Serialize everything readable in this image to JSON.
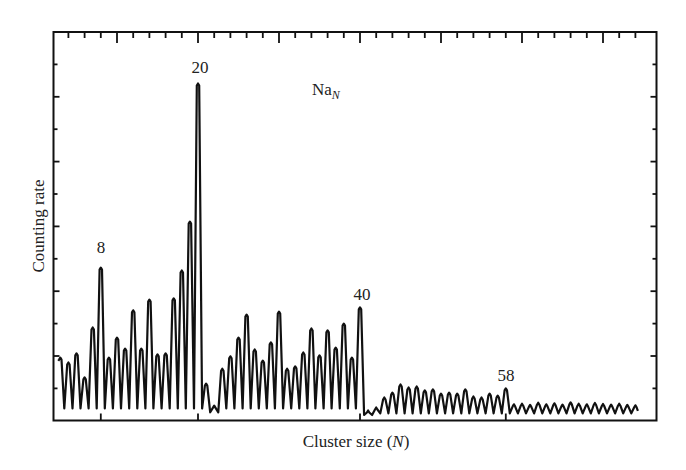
{
  "chart_data": {
    "type": "line",
    "title": "",
    "annotation_species": "Na",
    "annotation_species_subscript": "N",
    "xlabel": "Cluster size",
    "xlabel_var": "N",
    "ylabel": "Counting rate",
    "xlim": [
      2,
      77
    ],
    "ylim": [
      0,
      12
    ],
    "grid": false,
    "legend": null,
    "x_major_tick_step": 10,
    "x_minor_tick_step": 2,
    "y_tick_count": 11,
    "tick_labels_shown": false,
    "peak_annotations": [
      {
        "label": "8",
        "n": 8
      },
      {
        "label": "20",
        "n": 20
      },
      {
        "label": "40",
        "n": 40
      },
      {
        "label": "58",
        "n": 58
      }
    ],
    "bottom_axis_marks": [
      8,
      20,
      40,
      58
    ],
    "x": [
      3,
      4,
      5,
      6,
      7,
      8,
      9,
      10,
      11,
      12,
      13,
      14,
      15,
      16,
      17,
      18,
      19,
      20,
      21,
      22,
      23,
      24,
      25,
      26,
      27,
      28,
      29,
      30,
      31,
      32,
      33,
      34,
      35,
      36,
      37,
      38,
      39,
      40,
      41,
      42,
      43,
      44,
      45,
      46,
      47,
      48,
      49,
      50,
      51,
      52,
      53,
      54,
      55,
      56,
      57,
      58,
      59,
      60,
      61,
      62,
      63,
      64,
      65,
      66,
      67,
      68,
      69,
      70,
      71,
      72,
      73,
      74
    ],
    "series": [
      {
        "name": "Na_N peak intensity",
        "values": [
          1.94,
          1.79,
          2.07,
          1.33,
          2.87,
          4.72,
          1.94,
          2.56,
          2.22,
          3.4,
          2.22,
          3.73,
          2.04,
          2.07,
          3.77,
          4.63,
          6.14,
          10.4,
          1.14,
          0.46,
          1.6,
          1.98,
          2.56,
          3.27,
          2.19,
          1.85,
          2.41,
          3.36,
          1.6,
          1.67,
          2.1,
          2.84,
          2.01,
          2.78,
          2.25,
          2.99,
          1.94,
          3.49,
          0.31,
          0.4,
          0.71,
          0.86,
          1.11,
          1.02,
          1.05,
          0.93,
          0.96,
          0.83,
          0.86,
          0.83,
          0.96,
          0.74,
          0.71,
          0.83,
          0.77,
          0.99,
          0.5,
          0.52,
          0.48,
          0.55,
          0.5,
          0.53,
          0.49,
          0.56,
          0.52,
          0.5,
          0.54,
          0.51,
          0.49,
          0.52,
          0.48,
          0.47
        ]
      }
    ],
    "valley_level_below_40": 0.37,
    "valley_level_above_40": 0.22
  },
  "labels": {
    "peak_8": "8",
    "peak_20": "20",
    "peak_40": "40",
    "peak_58": "58",
    "species": "Na",
    "species_sub": "N",
    "ylabel": "Counting rate",
    "xlabel_prefix": "Cluster size (",
    "xlabel_var": "N",
    "xlabel_suffix": ")"
  }
}
